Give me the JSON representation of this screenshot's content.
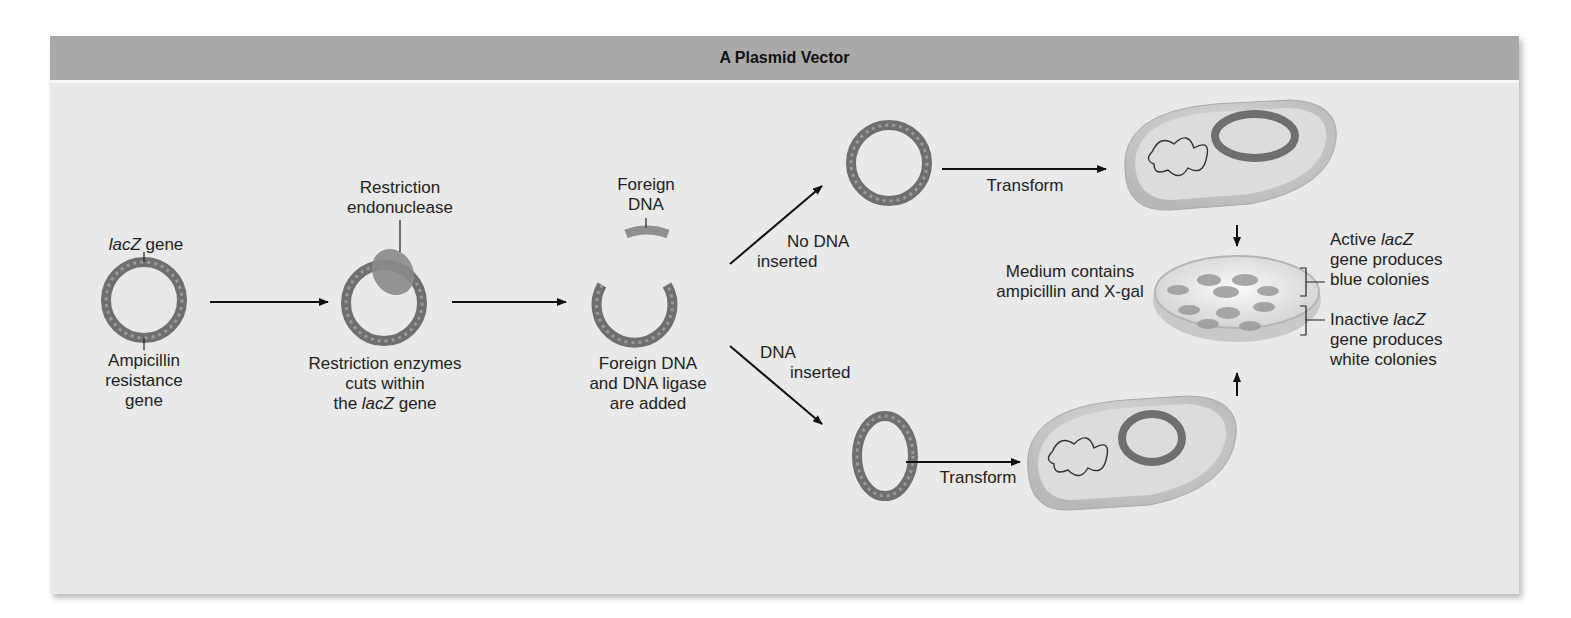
{
  "figure": {
    "title": "A Plasmid Vector",
    "colors": {
      "header_bg": "#a9a9a9",
      "panel_bg": "#e9e9e9",
      "dna_ring": "#6f6f6f",
      "enzyme": "#8a8a8a",
      "cell": "#cfcfcf"
    }
  },
  "step1": {
    "top_label_italic": "lacZ",
    "top_label_rest": " gene",
    "bottom_label": [
      "Ampicillin",
      "resistance",
      "gene"
    ]
  },
  "step2": {
    "top_label": [
      "Restriction",
      "endonuclease"
    ],
    "bottom_label_1": "Restriction enzymes",
    "bottom_label_2": "cuts within",
    "bottom_label_3_pre": "the ",
    "bottom_label_3_italic": "lacZ",
    "bottom_label_3_post": " gene"
  },
  "step3": {
    "top_label": [
      "Foreign",
      "DNA"
    ],
    "bottom_label": [
      "Foreign DNA",
      "and DNA ligase",
      "are added"
    ]
  },
  "branches": {
    "upper": [
      "No DNA",
      "inserted"
    ],
    "lower": [
      "DNA",
      "inserted"
    ]
  },
  "transform": {
    "upper_label": "Transform",
    "lower_label": "Transform"
  },
  "plate": {
    "medium_label": [
      "Medium contains",
      "ampicillin and X-gal"
    ],
    "active": {
      "line1_pre": "Active ",
      "line1_italic": "lacZ",
      "line2": "gene produces",
      "line3": "blue colonies"
    },
    "inactive": {
      "line1_pre": "Inactive ",
      "line1_italic": "lacZ",
      "line2": "gene produces",
      "line3": "white colonies"
    }
  }
}
